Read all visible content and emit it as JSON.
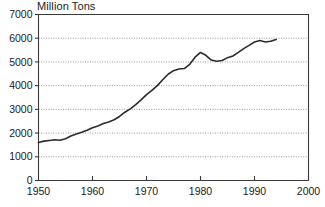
{
  "chart_data": {
    "type": "line",
    "title": "Million Tons",
    "xlabel": "",
    "ylabel": "Million Tons",
    "xlim": [
      1950,
      2000
    ],
    "ylim": [
      0,
      7000
    ],
    "grid": true,
    "grid_axis": "y",
    "legend": false,
    "legend_position": "none",
    "line_color": "#2b2b2b",
    "grid_color": "#8c8c8c",
    "axis_color": "#3a3a3a",
    "background_color": "#ffffff",
    "yticks": [
      0,
      1000,
      2000,
      3000,
      4000,
      5000,
      6000,
      7000
    ],
    "ytick_labels": [
      "0",
      "1000",
      "2000",
      "3000",
      "4000",
      "5000",
      "6000",
      "7000"
    ],
    "xticks": [
      1950,
      1960,
      1970,
      1980,
      1990,
      2000
    ],
    "xtick_labels": [
      "1950",
      "1960",
      "1970",
      "1980",
      "1990",
      "2000"
    ],
    "x": [
      1950,
      1951,
      1952,
      1953,
      1954,
      1955,
      1956,
      1957,
      1958,
      1959,
      1960,
      1961,
      1962,
      1963,
      1964,
      1965,
      1966,
      1967,
      1968,
      1969,
      1970,
      1971,
      1972,
      1973,
      1974,
      1975,
      1976,
      1977,
      1978,
      1979,
      1980,
      1981,
      1982,
      1983,
      1984,
      1985,
      1986,
      1987,
      1988,
      1989,
      1990,
      1991,
      1992,
      1993,
      1994
    ],
    "values": [
      1600,
      1660,
      1690,
      1720,
      1700,
      1760,
      1880,
      1960,
      2030,
      2120,
      2220,
      2300,
      2400,
      2470,
      2560,
      2700,
      2880,
      3020,
      3200,
      3400,
      3620,
      3800,
      4000,
      4250,
      4480,
      4630,
      4700,
      4720,
      4900,
      5200,
      5400,
      5280,
      5080,
      5030,
      5060,
      5180,
      5250,
      5400,
      5560,
      5700,
      5840,
      5900,
      5840,
      5870,
      5950
    ],
    "series": [
      {
        "name": "Million Tons",
        "values": [
          1600,
          1660,
          1690,
          1720,
          1700,
          1760,
          1880,
          1960,
          2030,
          2120,
          2220,
          2300,
          2400,
          2470,
          2560,
          2700,
          2880,
          3020,
          3200,
          3400,
          3620,
          3800,
          4000,
          4250,
          4480,
          4630,
          4700,
          4720,
          4900,
          5200,
          5400,
          5280,
          5080,
          5030,
          5060,
          5180,
          5250,
          5400,
          5560,
          5700,
          5840,
          5900,
          5840,
          5870,
          5950
        ]
      }
    ],
    "annotations": []
  }
}
